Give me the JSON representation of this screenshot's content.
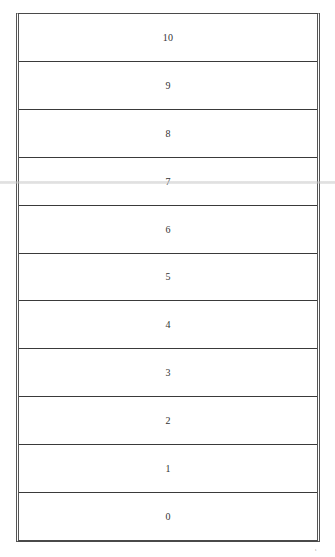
{
  "diagram": {
    "type": "vertical-stack",
    "orientation": "top-to-bottom descending",
    "rows": [
      {
        "label": "10"
      },
      {
        "label": "9"
      },
      {
        "label": "8"
      },
      {
        "label": "7"
      },
      {
        "label": "6"
      },
      {
        "label": "5"
      },
      {
        "label": "4"
      },
      {
        "label": "3"
      },
      {
        "label": "2"
      },
      {
        "label": "1"
      },
      {
        "label": "0"
      }
    ],
    "colors": {
      "border": "#4a4a4a",
      "text": "#333333",
      "background": "#ffffff"
    }
  },
  "footer": {
    "corner_mark": "ι"
  }
}
